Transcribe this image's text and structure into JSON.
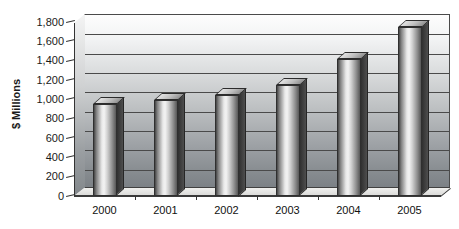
{
  "chart_data": {
    "type": "bar",
    "title": "",
    "categories": [
      "2000",
      "2001",
      "2002",
      "2003",
      "2004",
      "2005"
    ],
    "values": [
      950,
      990,
      1050,
      1150,
      1420,
      1750
    ],
    "xlabel": "",
    "ylabel": "$ Millions",
    "ylim": [
      0,
      1800
    ],
    "ytick_interval": 200,
    "ytick_labels": [
      "0",
      "200",
      "400",
      "600",
      "800",
      "1,000",
      "1,200",
      "1,400",
      "1,600",
      "1,800"
    ],
    "grid": true,
    "legend": false,
    "style": "3d-gray-gradient"
  },
  "colors": {
    "wall_top": "#fdfdfd",
    "wall_bottom": "#7c8186",
    "gridline": "#4a4a4a",
    "frame": "#4a4a4a",
    "bar_edge_dark": "#454545",
    "bar_highlight": "#f3f3f3",
    "bar_side": "#303030",
    "bar_top_face": "#bdbdbd",
    "floor": "#e9e9e7",
    "text": "#1a1a1a"
  }
}
